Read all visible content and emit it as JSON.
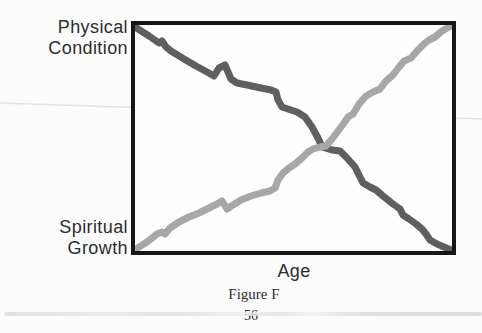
{
  "labels": {
    "y_top": "Physical Condition",
    "y_bottom": "Spiritual Growth",
    "x": "Age"
  },
  "caption": "Figure F",
  "page_number": "56",
  "colors": {
    "physical_line": "#5f5f5f",
    "spiritual_line": "#a7a7a7",
    "box_border": "#161616",
    "text": "#2c2c2c",
    "scan_artifact": "#cfcfcf"
  },
  "chart_data": {
    "type": "line",
    "title": "Figure F",
    "xlabel": "Age",
    "ylabel_top_left": "Physical Condition",
    "ylabel_bottom_left": "Spiritual Growth",
    "axes_style": "qualitative conceptual chart, no numeric ticks or gridlines, single framed plot box",
    "legend_position": "none (series identified by the two y-axis labels)",
    "line_width_px": 7,
    "plot_area": {
      "width": 317,
      "height": 226
    },
    "series": [
      {
        "name": "Physical Condition",
        "trend": "starts at maximum at youngest age, declines jaggedly to minimum at oldest age",
        "color": "#5f5f5f",
        "points_px": [
          [
            0,
            2
          ],
          [
            14,
            11
          ],
          [
            24,
            18
          ],
          [
            27,
            16
          ],
          [
            31,
            22
          ],
          [
            36,
            26
          ],
          [
            49,
            34
          ],
          [
            61,
            41
          ],
          [
            72,
            47
          ],
          [
            79,
            51
          ],
          [
            84,
            43
          ],
          [
            90,
            40
          ],
          [
            96,
            54
          ],
          [
            102,
            58
          ],
          [
            112,
            60
          ],
          [
            126,
            63
          ],
          [
            136,
            65
          ],
          [
            141,
            67
          ],
          [
            143,
            75
          ],
          [
            147,
            82
          ],
          [
            156,
            85
          ],
          [
            162,
            87
          ],
          [
            170,
            92
          ],
          [
            177,
            102
          ],
          [
            183,
            113
          ],
          [
            187,
            122
          ],
          [
            197,
            125
          ],
          [
            205,
            126
          ],
          [
            212,
            133
          ],
          [
            220,
            142
          ],
          [
            228,
            158
          ],
          [
            235,
            162
          ],
          [
            241,
            165
          ],
          [
            248,
            171
          ],
          [
            258,
            179
          ],
          [
            265,
            184
          ],
          [
            268,
            190
          ],
          [
            274,
            194
          ],
          [
            281,
            199
          ],
          [
            287,
            204
          ],
          [
            291,
            209
          ],
          [
            295,
            215
          ],
          [
            302,
            219
          ],
          [
            309,
            222
          ],
          [
            316,
            225
          ]
        ]
      },
      {
        "name": "Spiritual Growth",
        "trend": "starts at minimum at youngest age, rises jaggedly to maximum at oldest age, crossing the other line near mid-age",
        "color": "#a7a7a7",
        "points_px": [
          [
            1,
            224
          ],
          [
            12,
            217
          ],
          [
            22,
            209
          ],
          [
            27,
            207
          ],
          [
            30,
            209
          ],
          [
            35,
            203
          ],
          [
            44,
            197
          ],
          [
            54,
            192
          ],
          [
            64,
            188
          ],
          [
            74,
            183
          ],
          [
            82,
            179
          ],
          [
            87,
            176
          ],
          [
            92,
            184
          ],
          [
            98,
            180
          ],
          [
            106,
            175
          ],
          [
            116,
            171
          ],
          [
            126,
            168
          ],
          [
            135,
            166
          ],
          [
            140,
            163
          ],
          [
            143,
            155
          ],
          [
            148,
            148
          ],
          [
            154,
            143
          ],
          [
            160,
            139
          ],
          [
            167,
            133
          ],
          [
            173,
            127
          ],
          [
            178,
            124
          ],
          [
            185,
            122
          ],
          [
            191,
            121
          ],
          [
            197,
            114
          ],
          [
            203,
            106
          ],
          [
            209,
            98
          ],
          [
            213,
            92
          ],
          [
            218,
            89
          ],
          [
            224,
            79
          ],
          [
            231,
            71
          ],
          [
            238,
            67
          ],
          [
            245,
            64
          ],
          [
            251,
            56
          ],
          [
            258,
            50
          ],
          [
            264,
            42
          ],
          [
            269,
            36
          ],
          [
            276,
            33
          ],
          [
            282,
            26
          ],
          [
            289,
            19
          ],
          [
            294,
            15
          ],
          [
            300,
            12
          ],
          [
            307,
            6
          ],
          [
            314,
            2
          ],
          [
            316,
            1
          ]
        ]
      }
    ]
  }
}
